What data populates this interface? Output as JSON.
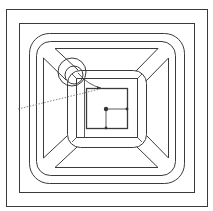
{
  "figure": {
    "kind": "cad-top-view",
    "colors": {
      "line": "#3a3a3a",
      "dashed": "#777777",
      "point": "#333333",
      "background": "#ffffff"
    }
  },
  "geometry": {
    "outer_border": {
      "x": 6,
      "y": 9,
      "w": 202,
      "h": 198
    },
    "inner_border": {
      "x": 19,
      "y": 23,
      "w": 176,
      "h": 170
    },
    "rounded_outer": {
      "x": 29,
      "y": 33,
      "w": 156,
      "h": 151,
      "r": 20
    },
    "rounded_second": {
      "x": 36,
      "y": 41,
      "w": 140,
      "h": 135,
      "r": 14
    },
    "chamfer_square_outer": {
      "x": 37,
      "y": 41,
      "w": 138,
      "h": 135
    },
    "rounded_inner": {
      "x": 67,
      "y": 70,
      "w": 80,
      "h": 78,
      "r": 13
    },
    "inner_square": {
      "x": 76,
      "y": 78,
      "w": 62,
      "h": 60
    },
    "innermost_box": {
      "x": 86,
      "y": 88,
      "w": 42,
      "h": 41
    },
    "tool_circle_large": {
      "cx": 72,
      "cy": 72,
      "r": 14
    },
    "tool_circle_small": {
      "cx": 74,
      "cy": 75,
      "r": 9
    },
    "center_point": {
      "cx": 106,
      "cy": 109
    },
    "right_point": {
      "cx": 127,
      "cy": 109
    },
    "bottom_point": {
      "cx": 106,
      "cy": 128
    },
    "arrow_tip": {
      "x": 101,
      "y": 88
    },
    "dashed_leader": {
      "x1": 18,
      "y1": 109,
      "x2": 100,
      "y2": 89
    }
  }
}
